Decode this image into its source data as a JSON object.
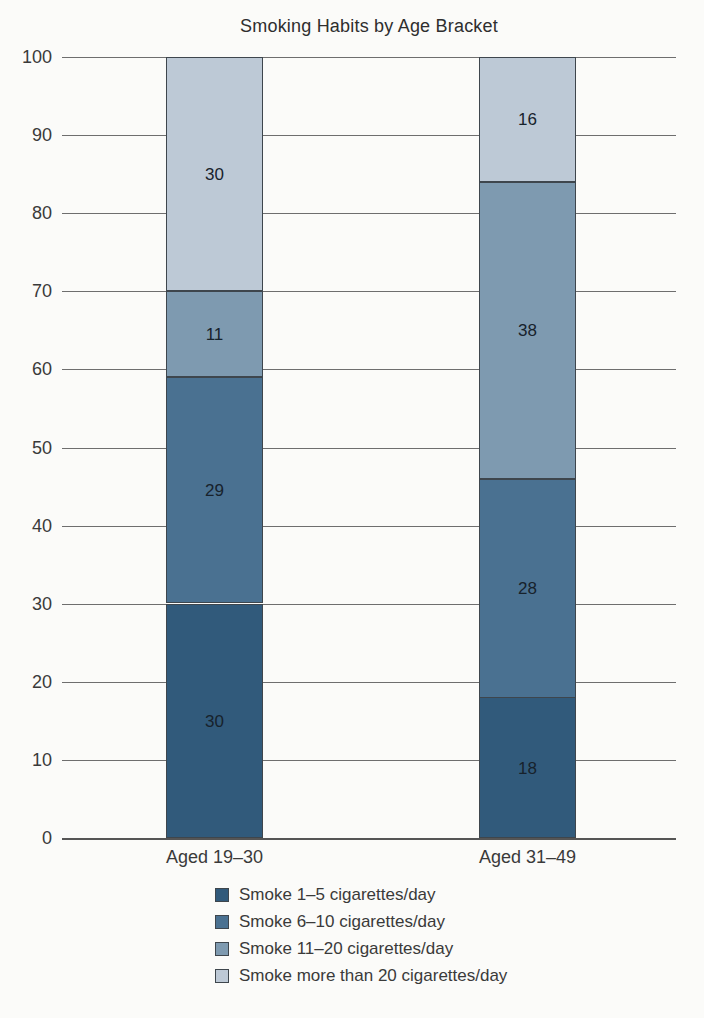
{
  "chart_data": {
    "type": "bar",
    "stacked": true,
    "title": "Smoking Habits by Age Bracket",
    "categories": [
      "Aged 19–30",
      "Aged 31–49"
    ],
    "series": [
      {
        "name": "Smoke 1–5 cigarettes/day",
        "color": "#315a7b",
        "values": [
          30,
          18
        ]
      },
      {
        "name": "Smoke 6–10 cigarettes/day",
        "color": "#4a7191",
        "values": [
          29,
          28
        ]
      },
      {
        "name": "Smoke 11–20 cigarettes/day",
        "color": "#7e9ab0",
        "values": [
          11,
          38
        ]
      },
      {
        "name": "Smoke more than 20 cigarettes/day",
        "color": "#bdc9d6",
        "values": [
          30,
          16
        ]
      }
    ],
    "xlabel": "",
    "ylabel": "",
    "ylim": [
      0,
      100
    ],
    "yticks": [
      0,
      10,
      20,
      30,
      40,
      50,
      60,
      70,
      80,
      90,
      100
    ],
    "grid": true,
    "legend_position": "bottom",
    "colors": {
      "gridline": "#6e6e6e",
      "segment_border": "#3e464d",
      "text": "#3a3a3a"
    }
  }
}
